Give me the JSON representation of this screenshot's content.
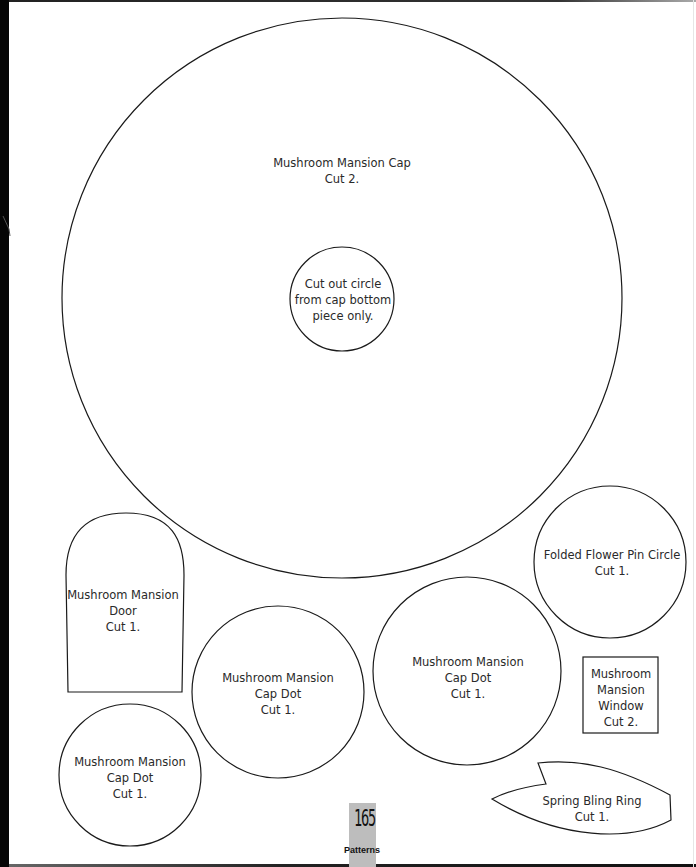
{
  "page": {
    "number": "165",
    "section": "Patterns"
  },
  "pieces": {
    "cap": {
      "name": "Mushroom Mansion Cap",
      "cut": "Cut 2."
    },
    "cap_cutout": {
      "line1": "Cut out circle",
      "line2": "from cap bottom",
      "line3": "piece only."
    },
    "door": {
      "line1": "Mushroom Mansion",
      "line2": "Door",
      "cut": "Cut 1."
    },
    "cap_dot_small": {
      "line1": "Mushroom Mansion",
      "line2": "Cap Dot",
      "cut": "Cut 1."
    },
    "cap_dot_middle": {
      "line1": "Mushroom Mansion",
      "line2": "Cap Dot",
      "cut": "Cut 1."
    },
    "cap_dot_large": {
      "line1": "Mushroom Mansion",
      "line2": "Cap Dot",
      "cut": "Cut 1."
    },
    "flower_pin": {
      "name": "Folded Flower Pin Circle",
      "cut": "Cut 1."
    },
    "window": {
      "line1": "Mushroom",
      "line2": "Mansion",
      "line3": "Window",
      "cut": "Cut 2."
    },
    "ring": {
      "name": "Spring Bling Ring",
      "cut": "Cut 1."
    }
  },
  "colors": {
    "outline": "#1a1a1a",
    "text": "#2a2a2a",
    "badge": "#bdbdbd"
  }
}
